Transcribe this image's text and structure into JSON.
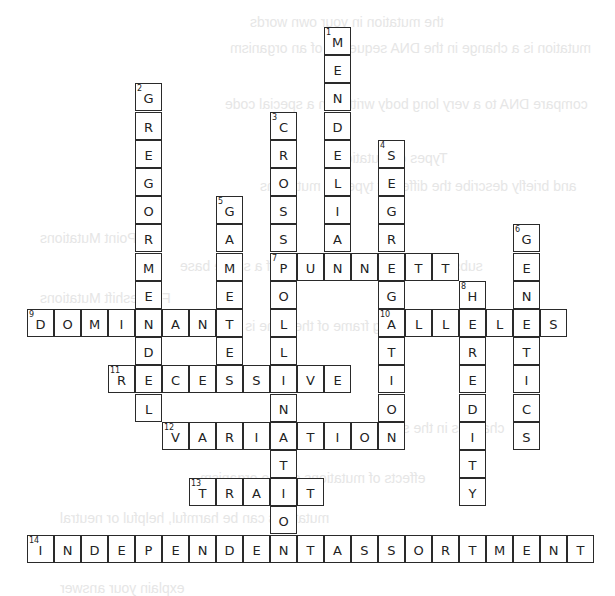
{
  "puzzle": {
    "type": "crossword",
    "grid": {
      "origin_x": 27,
      "origin_y": 27,
      "cell_w": 27,
      "cell_h": 28.2
    },
    "words": [
      {
        "number": 1,
        "direction": "down",
        "answer": "MENDELIAN",
        "row": 0,
        "col": 11
      },
      {
        "number": 2,
        "direction": "down",
        "answer": "GREGORMENDEL",
        "row": 2,
        "col": 4
      },
      {
        "number": 3,
        "direction": "down",
        "answer": "CROSSPOLLINATION",
        "row": 3,
        "col": 9
      },
      {
        "number": 4,
        "direction": "down",
        "answer": "SEGREGATION",
        "row": 4,
        "col": 13
      },
      {
        "number": 5,
        "direction": "down",
        "answer": "GAMETES",
        "row": 6,
        "col": 7
      },
      {
        "number": 6,
        "direction": "down",
        "answer": "GENETICS",
        "row": 7,
        "col": 18
      },
      {
        "number": 7,
        "direction": "across",
        "answer": "PUNNETT",
        "row": 8,
        "col": 9
      },
      {
        "number": 8,
        "direction": "down",
        "answer": "HEREDITY",
        "row": 9,
        "col": 16
      },
      {
        "number": 9,
        "direction": "across",
        "answer": "DOMINANT",
        "row": 10,
        "col": 0
      },
      {
        "number": 10,
        "direction": "across",
        "answer": "ALLELES",
        "row": 10,
        "col": 13
      },
      {
        "number": 11,
        "direction": "across",
        "answer": "RECESSIVE",
        "row": 12,
        "col": 3
      },
      {
        "number": 12,
        "direction": "across",
        "answer": "VARIATION",
        "row": 14,
        "col": 5
      },
      {
        "number": 13,
        "direction": "across",
        "answer": "TRAIT",
        "row": 16,
        "col": 6
      },
      {
        "number": 14,
        "direction": "across",
        "answer": "INDEPENDENTASSORTMENT",
        "row": 18,
        "col": 0
      }
    ]
  },
  "background_bleed": [
    {
      "text": "the mutation in your own words",
      "x": 250,
      "y": 14
    },
    {
      "text": "mutation is a change in the DNA sequence of an organism",
      "x": 230,
      "y": 40
    },
    {
      "text": "compare DNA to a very long body written in a special code",
      "x": 225,
      "y": 96
    },
    {
      "text": "Types of Mutations",
      "x": 330,
      "y": 150
    },
    {
      "text": "and briefly describe the different types of mutations",
      "x": 260,
      "y": 178
    },
    {
      "text": "Point Mutations",
      "x": 40,
      "y": 230
    },
    {
      "text": "substitution, insertion or deletion of a single base",
      "x": 180,
      "y": 258
    },
    {
      "text": "Frameshift Mutations",
      "x": 40,
      "y": 290
    },
    {
      "text": "reading frame of the gene is shifted",
      "x": 200,
      "y": 318
    },
    {
      "text": "changes in the structure or number of chromosomes",
      "x": 180,
      "y": 420
    },
    {
      "text": "effects of mutations on the organism",
      "x": 200,
      "y": 470
    },
    {
      "text": "mutations can be harmful, helpful or neutral",
      "x": 60,
      "y": 510
    },
    {
      "text": "explain your answer",
      "x": 60,
      "y": 580
    }
  ]
}
